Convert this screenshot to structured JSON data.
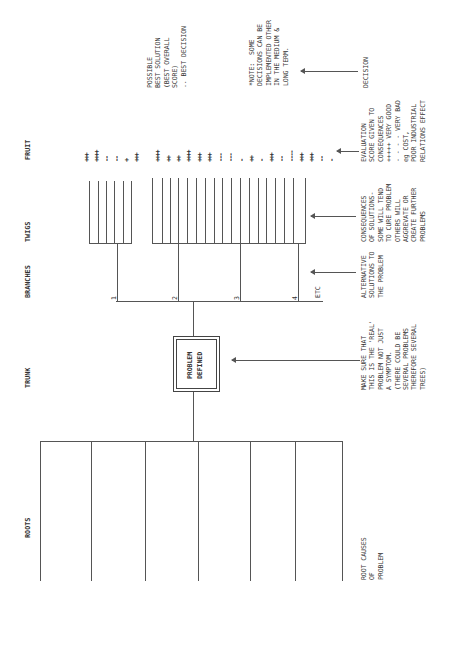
{
  "headers": {
    "roots": "ROOTS",
    "trunk": "TRUNK",
    "branches": "BRANCHES",
    "twigs": "TWIGS",
    "fruit": "FRUIT"
  },
  "trunk_box": {
    "line1": "PROBLEM",
    "line2": "DEFINED"
  },
  "branch_numbers": [
    "1",
    "2",
    "3",
    "4"
  ],
  "branch_etc": "ETC",
  "annotations": {
    "roots": "ROOT CAUSES\nOF\nPROBLEM",
    "trunk": "MAKE SURE THAT\nTHIS IS THE 'REAL'\nPROBLEM NOT JUST\nA SYMPTOM.\n(THERE COULD BE\nSEVERAL PROBLEMS\nTHEREFORE SEVERAL\nTREES)",
    "branches": "ALTERNATIVE\nSOLUTIONS TO\nTHE PROBLEM",
    "twigs": "CONSEQUENCES\nOF SOLUTIONS-\nSOME WILL TEND\nTO CURE PROBLEM\nOTHERS WILL\nAGGREVATE OR\nCREATE FURTHER\nPROBLEMS",
    "fruit": "EVALUATION\nSCORE GIVEN TO\nCONSEQUENCES\n+++++ VERY GOOD\n- - - - VERY BAD\neg COST,\nPOOR INDUSTRIAL\nRELATIONS EFFECT",
    "decision": "DECISION",
    "note": "*NOTE:  SOME\nDECISIONS CAN BE\nIMPLEMENTED OTHER\nIN THE MEDIUM &\nLONG TERM.",
    "best": "POSSIBLE\nBEST SOLUTION\n(BEST OVERALL\nSCORE)\n.. BEST DECISION"
  },
  "fruit_scores": {
    "branch_1": [
      "+++",
      "++++",
      "--",
      "--",
      "+",
      "+++"
    ],
    "branches_2_4": [
      "++++",
      "++",
      "++",
      "++++",
      "+++",
      "+++",
      "---",
      "---",
      "-",
      "++",
      "-",
      "+++",
      "--",
      "----",
      "+++",
      "+++",
      "--",
      "-"
    ]
  },
  "colors": {
    "ink": "#333333",
    "line": "#555555",
    "background": "#ffffff"
  }
}
